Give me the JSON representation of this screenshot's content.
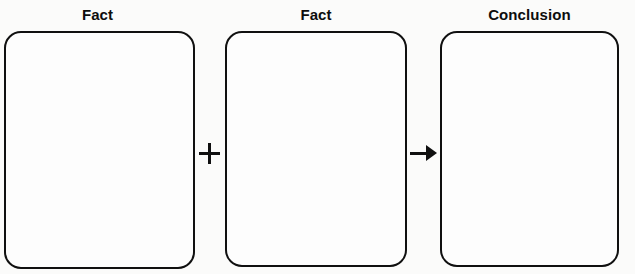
{
  "diagram": {
    "type": "logic-argument-organizer",
    "background_color": "#fbfbfa",
    "stroke_color": "#101010",
    "box_fill_color": "#fdfdfd",
    "columns": [
      {
        "label": "Fact",
        "box_content": "",
        "connector_after": "plus"
      },
      {
        "label": "Fact",
        "box_content": "",
        "connector_after": "arrow"
      },
      {
        "label": "Conclusion",
        "box_content": "",
        "connector_after": null
      }
    ],
    "connectors": [
      {
        "name": "plus",
        "glyph": "+"
      },
      {
        "name": "arrow",
        "glyph": "→"
      }
    ]
  }
}
